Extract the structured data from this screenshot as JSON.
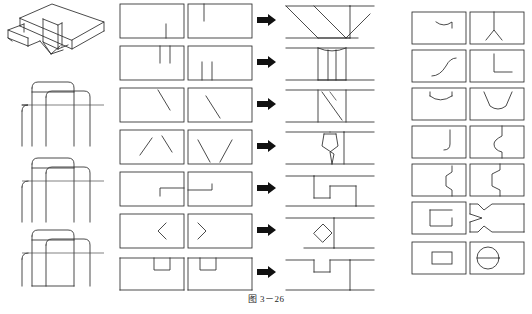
{
  "figure": {
    "caption": "图 3－26",
    "caption_number": "3－26",
    "caption_label": "图",
    "kind": "engineering-drawing-exercise",
    "width": 532,
    "height": 314,
    "colors": {
      "line": "#2b2b2b",
      "thin_line": "#4a4a4a",
      "arrow": "#111111",
      "background": "#ffffff",
      "caption_text": "#262626"
    }
  },
  "panels": {
    "left": {
      "name": "pictorial-and-projection-column",
      "items": [
        {
          "id": "isometric-view",
          "type": "isometric",
          "label": "立体图"
        },
        {
          "id": "projection-view-1",
          "type": "orthographic",
          "label": "投影图 1"
        },
        {
          "id": "projection-view-2",
          "type": "orthographic",
          "label": "投影图 2"
        },
        {
          "id": "projection-view-3",
          "type": "orthographic",
          "label": "投影图 3"
        }
      ]
    },
    "middle": {
      "name": "view-transformation-exercise-grid",
      "columns": [
        "第一视图",
        "第二视图",
        "结果视图"
      ],
      "arrow_glyph": "➡",
      "rows": [
        {
          "index": 1,
          "col1": "rect-with-bottom-stub-right",
          "col2": "rect-with-top-stub-left",
          "result": "parallel-diagonal-slots"
        },
        {
          "index": 2,
          "col1": "rect-with-two-top-stubs",
          "col2": "rect-with-two-bottom-stubs",
          "result": "central-rib-block"
        },
        {
          "index": 3,
          "col1": "rect-with-single-diagonal-right",
          "col2": "rect-with-single-diagonal-left",
          "result": "inclined-slot-block"
        },
        {
          "index": 4,
          "col1": "rect-with-two-diagonals-up",
          "col2": "rect-with-two-diagonals-down",
          "result": "waisted-taper-block"
        },
        {
          "index": 5,
          "col1": "rect-with-small-step-right",
          "col2": "rect-with-small-step-left",
          "result": "stepped-notch-block"
        },
        {
          "index": 6,
          "col1": "rect-with-left-chevron",
          "col2": "rect-with-right-chevron",
          "result": "diamond-hole-block"
        },
        {
          "index": 7,
          "col1": "rect-with-bottom-notch-right",
          "col2": "rect-with-bottom-notch-left",
          "result": "square-notch-block"
        }
      ]
    },
    "right": {
      "name": "answer-key-grid",
      "rows": [
        {
          "index": 1,
          "left": "shallow-arc-notch-top",
          "right": "vee-peak-with-stem"
        },
        {
          "index": 2,
          "left": "diagonal-ramp",
          "right": "right-angle-corner"
        },
        {
          "index": 3,
          "left": "shallow-curved-dip",
          "right": "vee-groove-wide"
        },
        {
          "index": 4,
          "left": "rounded-step-right",
          "right": "stepped-profile-curve"
        },
        {
          "index": 5,
          "left": "double-step-notch",
          "right": "bracket-step-profile"
        },
        {
          "index": 6,
          "left": "open-rectangle-channel",
          "right": "notched-bar-profile"
        },
        {
          "index": 7,
          "left": "solid-rectangle-hole",
          "right": "circle-split-horizontal"
        }
      ]
    }
  }
}
